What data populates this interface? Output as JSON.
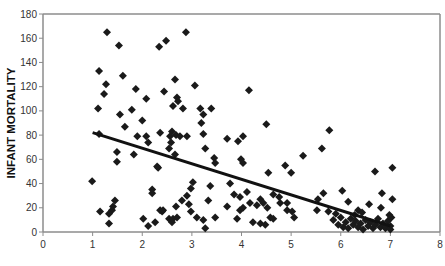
{
  "chart_data": {
    "type": "scatter",
    "title": "",
    "xlabel": "",
    "ylabel": "INFANT MORTALITY",
    "xlim": [
      0,
      8
    ],
    "ylim": [
      0,
      180
    ],
    "x_ticks": [
      0,
      1,
      2,
      3,
      4,
      5,
      6,
      7,
      8
    ],
    "y_ticks": [
      0,
      20,
      40,
      60,
      80,
      100,
      120,
      140,
      160,
      180
    ],
    "grid": false,
    "legend": "none",
    "marker": "diamond",
    "marker_color": "#1a1a1a",
    "series": [
      {
        "name": "observations",
        "points": [
          [
            1.29,
            165
          ],
          [
            1.53,
            154
          ],
          [
            2.34,
            153
          ],
          [
            2.48,
            158
          ],
          [
            2.88,
            165
          ],
          [
            1.13,
            133
          ],
          [
            1.61,
            129
          ],
          [
            1.27,
            122
          ],
          [
            1.23,
            114
          ],
          [
            1.11,
            102
          ],
          [
            1.87,
            118
          ],
          [
            2.08,
            110
          ],
          [
            1.79,
            101
          ],
          [
            1.55,
            97
          ],
          [
            1.65,
            87
          ],
          [
            2.0,
            92
          ],
          [
            2.66,
            126
          ],
          [
            3.06,
            121
          ],
          [
            2.44,
            116
          ],
          [
            2.7,
            111
          ],
          [
            2.72,
            108
          ],
          [
            2.62,
            104
          ],
          [
            2.82,
            102
          ],
          [
            4.15,
            117
          ],
          [
            3.17,
            102
          ],
          [
            3.39,
            102
          ],
          [
            3.23,
            97
          ],
          [
            3.19,
            90
          ],
          [
            4.5,
            89
          ],
          [
            1.13,
            81
          ],
          [
            1.9,
            79
          ],
          [
            2.08,
            79
          ],
          [
            2.12,
            74
          ],
          [
            2.36,
            82
          ],
          [
            1.49,
            66
          ],
          [
            1.49,
            58
          ],
          [
            1.83,
            64
          ],
          [
            2.3,
            54
          ],
          [
            2.6,
            83
          ],
          [
            2.56,
            79
          ],
          [
            2.68,
            80
          ],
          [
            2.76,
            79
          ],
          [
            2.9,
            79
          ],
          [
            2.58,
            74
          ],
          [
            3.23,
            81
          ],
          [
            3.71,
            77
          ],
          [
            3.93,
            75
          ],
          [
            4.03,
            79
          ],
          [
            2.54,
            69
          ],
          [
            3.27,
            69
          ],
          [
            2.66,
            64
          ],
          [
            3.45,
            61
          ],
          [
            3.47,
            57
          ],
          [
            3.99,
            60
          ],
          [
            4.03,
            57
          ],
          [
            4.88,
            55
          ],
          [
            5.77,
            84
          ],
          [
            5.62,
            69
          ],
          [
            5.24,
            63
          ],
          [
            5.0,
            49
          ],
          [
            6.69,
            50
          ],
          [
            7.04,
            53
          ],
          [
            0.99,
            42
          ],
          [
            1.45,
            26
          ],
          [
            1.41,
            21
          ],
          [
            1.39,
            18
          ],
          [
            1.33,
            15
          ],
          [
            1.15,
            17
          ],
          [
            1.33,
            7
          ],
          [
            2.2,
            35
          ],
          [
            2.2,
            32
          ],
          [
            2.32,
            53
          ],
          [
            2.36,
            18
          ],
          [
            2.4,
            17
          ],
          [
            2.02,
            11
          ],
          [
            2.12,
            5
          ],
          [
            2.26,
            8
          ],
          [
            2.54,
            11
          ],
          [
            2.42,
            18
          ],
          [
            3.02,
            41
          ],
          [
            2.98,
            36
          ],
          [
            2.9,
            30
          ],
          [
            2.8,
            26
          ],
          [
            2.68,
            21
          ],
          [
            2.94,
            23
          ],
          [
            2.98,
            17
          ],
          [
            2.62,
            11
          ],
          [
            2.6,
            8
          ],
          [
            2.7,
            12
          ],
          [
            3.1,
            12
          ],
          [
            3.23,
            10
          ],
          [
            3.27,
            3
          ],
          [
            3.37,
            38
          ],
          [
            3.33,
            26
          ],
          [
            3.47,
            12
          ],
          [
            3.77,
            40
          ],
          [
            3.71,
            21
          ],
          [
            3.85,
            31
          ],
          [
            3.97,
            29
          ],
          [
            4.11,
            33
          ],
          [
            3.97,
            18
          ],
          [
            4.03,
            20
          ],
          [
            3.91,
            11
          ],
          [
            4.17,
            24
          ],
          [
            4.31,
            22
          ],
          [
            4.38,
            27
          ],
          [
            4.54,
            49
          ],
          [
            4.44,
            24
          ],
          [
            4.52,
            20
          ],
          [
            4.23,
            8
          ],
          [
            4.38,
            7
          ],
          [
            4.48,
            6
          ],
          [
            4.58,
            12
          ],
          [
            4.64,
            11
          ],
          [
            4.64,
            31
          ],
          [
            4.76,
            29
          ],
          [
            4.78,
            24
          ],
          [
            4.92,
            18
          ],
          [
            5.65,
            32
          ],
          [
            6.03,
            34
          ],
          [
            5.54,
            27
          ],
          [
            6.15,
            25
          ],
          [
            5.52,
            18
          ],
          [
            5.75,
            17
          ],
          [
            4.92,
            24
          ],
          [
            5.02,
            17
          ],
          [
            5.06,
            12
          ],
          [
            6.57,
            23
          ],
          [
            6.83,
            32
          ],
          [
            7.04,
            27
          ],
          [
            6.81,
            20
          ],
          [
            6.35,
            18
          ],
          [
            6.43,
            16
          ],
          [
            5.85,
            10
          ],
          [
            5.95,
            6
          ],
          [
            6.0,
            12
          ],
          [
            6.05,
            4
          ],
          [
            6.1,
            8
          ],
          [
            6.15,
            3
          ],
          [
            6.2,
            11
          ],
          [
            6.25,
            6
          ],
          [
            6.3,
            9
          ],
          [
            6.35,
            4
          ],
          [
            6.4,
            7
          ],
          [
            6.45,
            2
          ],
          [
            6.5,
            10
          ],
          [
            6.55,
            5
          ],
          [
            6.6,
            8
          ],
          [
            6.65,
            3
          ],
          [
            6.7,
            6
          ],
          [
            6.75,
            11
          ],
          [
            6.8,
            4
          ],
          [
            6.85,
            7
          ],
          [
            6.9,
            3
          ],
          [
            6.95,
            9
          ],
          [
            7.0,
            5
          ],
          [
            7.0,
            2
          ],
          [
            7.02,
            12
          ],
          [
            6.98,
            14
          ],
          [
            5.9,
            15
          ],
          [
            6.28,
            14
          ]
        ]
      }
    ],
    "trendline": {
      "type": "linear",
      "x": [
        1,
        7
      ],
      "y": [
        82,
        5
      ],
      "color": "#111111"
    },
    "frame_color": "#8c8c8c"
  }
}
